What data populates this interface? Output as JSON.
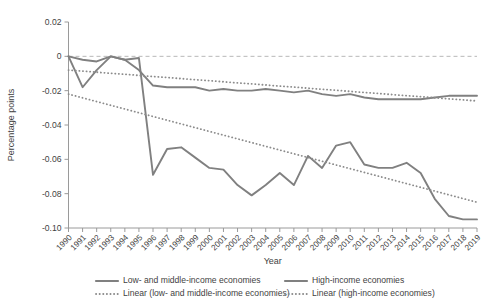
{
  "chart_data": {
    "type": "line",
    "title": "",
    "xlabel": "Year",
    "ylabel": "Percentage points",
    "ylim": [
      -0.1,
      0.02
    ],
    "xlim": [
      1990,
      2019
    ],
    "grid": false,
    "zero_line": true,
    "legend_position": "bottom",
    "y_ticks": [
      "0.02",
      "0",
      "-0.02",
      "-0.04",
      "-0.06",
      "-0.08",
      "-0.10"
    ],
    "y_tick_values": [
      0.02,
      0,
      -0.02,
      -0.04,
      -0.06,
      -0.08,
      -0.1
    ],
    "categories": [
      "1990",
      "1991",
      "1992",
      "1993",
      "1994",
      "1995",
      "1996",
      "1997",
      "1998",
      "1999",
      "2000",
      "2001",
      "2002",
      "2003",
      "2004",
      "2005",
      "2006",
      "2007",
      "2008",
      "2009",
      "2010",
      "2011",
      "2012",
      "2013",
      "2014",
      "2015",
      "2016",
      "2017",
      "2018",
      "2019"
    ],
    "series": [
      {
        "name": "Low- and middle-income economies",
        "style": "solid",
        "color": "#808080",
        "values": [
          0.0,
          -0.018,
          -0.008,
          0.0,
          -0.002,
          -0.001,
          -0.069,
          -0.054,
          -0.053,
          -0.059,
          -0.065,
          -0.066,
          -0.075,
          -0.081,
          -0.075,
          -0.068,
          -0.075,
          -0.058,
          -0.065,
          -0.052,
          -0.05,
          -0.063,
          -0.065,
          -0.065,
          -0.062,
          -0.068,
          -0.083,
          -0.093,
          -0.095,
          -0.095
        ]
      },
      {
        "name": "High-income economies",
        "style": "solid",
        "color": "#808080",
        "values": [
          0.0,
          -0.002,
          -0.003,
          0.0,
          -0.002,
          -0.008,
          -0.017,
          -0.018,
          -0.018,
          -0.018,
          -0.02,
          -0.019,
          -0.02,
          -0.02,
          -0.019,
          -0.02,
          -0.021,
          -0.02,
          -0.022,
          -0.023,
          -0.022,
          -0.024,
          -0.025,
          -0.025,
          -0.025,
          -0.025,
          -0.024,
          -0.023,
          -0.023,
          -0.023
        ]
      },
      {
        "name": "Linear (low- and middle-income economies)",
        "style": "dotted",
        "color": "#8c8c8c",
        "trend": true,
        "endpoints": [
          -0.022,
          -0.085
        ]
      },
      {
        "name": "Linear (high-income economies)",
        "style": "dotted",
        "color": "#8c8c8c",
        "trend": true,
        "endpoints": [
          -0.008,
          -0.026
        ]
      }
    ],
    "legend": [
      {
        "label": "Low- and middle-income economies",
        "style": "solid",
        "color": "#808080"
      },
      {
        "label": "High-income economies",
        "style": "solid",
        "color": "#808080"
      },
      {
        "label": "Linear (low- and middle-income economies)",
        "style": "dotted",
        "color": "#8c8c8c"
      },
      {
        "label": "Linear (high-income economies)",
        "style": "dotted",
        "color": "#8c8c8c"
      }
    ]
  }
}
